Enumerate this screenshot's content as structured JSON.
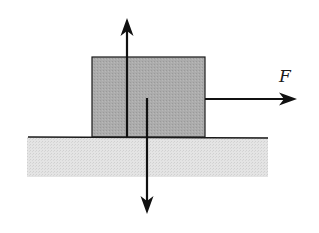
{
  "diagram": {
    "type": "free-body diagram",
    "colors": {
      "background": "#ffffff",
      "block_fill": "#a9a9a9",
      "ground_fill": "#e2e2e2",
      "stroke": "#1a1a1a"
    },
    "block": {
      "x": 92,
      "y": 57,
      "width": 113,
      "height": 80
    },
    "ground": {
      "x": 27,
      "y": 137,
      "width": 241,
      "height": 40
    },
    "forces": [
      {
        "name": "normal-force",
        "direction": "up",
        "label": ""
      },
      {
        "name": "weight",
        "direction": "down",
        "label": ""
      },
      {
        "name": "applied-force",
        "direction": "right",
        "label": "F"
      }
    ],
    "labels": {
      "applied_force": "F"
    }
  }
}
